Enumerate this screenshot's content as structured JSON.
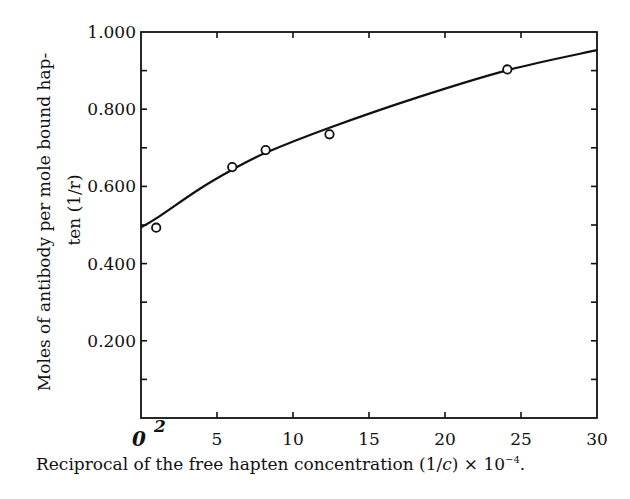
{
  "chart_data": {
    "type": "scatter",
    "title": "",
    "xlabel": "Reciprocal of the free hapten concentration (1/c) × 10⁻⁴.",
    "ylabel_line1": "Moles of antibody per mole bound hap-",
    "ylabel_line2": "ten (1/r)",
    "xlim": [
      0,
      30
    ],
    "ylim": [
      0,
      1.0
    ],
    "x_ticks": [
      0,
      5,
      10,
      15,
      20,
      25,
      30
    ],
    "x_tick_labels": [
      "0",
      "5",
      "10",
      "15",
      "20",
      "25",
      "30"
    ],
    "y_ticks": [
      0.2,
      0.4,
      0.6,
      0.8,
      1.0
    ],
    "y_tick_labels": [
      "0.200",
      "0.400",
      "0.600",
      "0.800",
      "1.000"
    ],
    "y_minor_ticks": [
      0.1,
      0.3,
      0.5,
      0.7,
      0.9
    ],
    "grid": false,
    "legend": null,
    "series": [
      {
        "name": "observed",
        "style": "open-circle",
        "points": [
          {
            "x": 1.0,
            "y": 0.493
          },
          {
            "x": 6.0,
            "y": 0.65
          },
          {
            "x": 8.2,
            "y": 0.694
          },
          {
            "x": 12.4,
            "y": 0.735
          },
          {
            "x": 24.1,
            "y": 0.903
          }
        ]
      },
      {
        "name": "fitted curve",
        "style": "solid-line",
        "points": [
          {
            "x": 0,
            "y": 0.494
          },
          {
            "x": 1,
            "y": 0.517
          },
          {
            "x": 3.8,
            "y": 0.592
          },
          {
            "x": 6,
            "y": 0.643
          },
          {
            "x": 8.2,
            "y": 0.687
          },
          {
            "x": 12.4,
            "y": 0.752
          },
          {
            "x": 18.3,
            "y": 0.832
          },
          {
            "x": 24.2,
            "y": 0.902
          },
          {
            "x": 30,
            "y": 0.953
          }
        ]
      }
    ],
    "annotations": [
      {
        "text": "0",
        "note": "handwritten zero at x-axis origin"
      },
      {
        "text": "2",
        "note": "handwritten mark near x=1 on x-axis"
      }
    ]
  },
  "labels": {
    "x_axis": "Reciprocal of the free hapten concentration (1/",
    "x_axis_var": "c",
    "x_axis_tail": ") × 10",
    "x_axis_exp": "−4",
    "x_axis_end": ".",
    "y_axis_line1": "Moles of antibody per mole bound hap-",
    "y_axis_line2": "ten (1/r)",
    "hand_zero": "0",
    "hand_two": "2"
  }
}
